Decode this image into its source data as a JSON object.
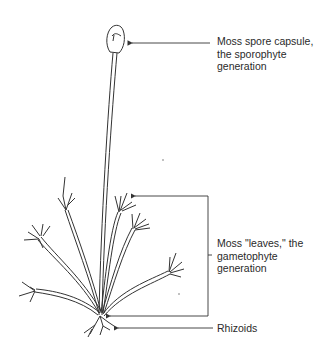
{
  "diagram": {
    "labels": [
      {
        "id": "capsule",
        "lines": [
          "Moss spore capsule,",
          "the sporophyte",
          "generation"
        ]
      },
      {
        "id": "leaves",
        "lines": [
          "Moss \"leaves,\" the",
          "gametophyte",
          "generation"
        ]
      },
      {
        "id": "rhizoids",
        "lines": [
          "Rhizoids"
        ]
      }
    ],
    "colors": {
      "line": "#333333",
      "fill": "#ffffff",
      "text": "#2a2a2a"
    }
  }
}
